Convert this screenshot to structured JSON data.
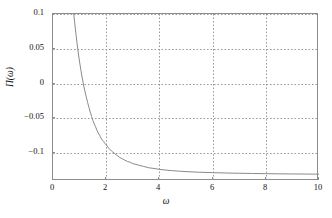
{
  "chart_data": {
    "type": "line",
    "title": "",
    "xlabel": "ω",
    "ylabel": "Π(ω)",
    "xlim": [
      0,
      10
    ],
    "ylim": [
      -0.14,
      0.1
    ],
    "grid": true,
    "grid_style": "dotted",
    "legend": null,
    "xticks": [
      0,
      2,
      4,
      6,
      8,
      10
    ],
    "xtick_labels": [
      "0",
      "2",
      "4",
      "6",
      "8",
      "10"
    ],
    "yticks": [
      -0.1,
      -0.05,
      0,
      0.05,
      0.1
    ],
    "ytick_labels": [
      "−0.1",
      "−0.05",
      "0",
      "0.05",
      "0.1"
    ],
    "series": [
      {
        "name": "Π(ω)",
        "color": "#8a8a8a",
        "linewidth": 1,
        "x": [
          0.78,
          0.82,
          0.86,
          0.9,
          0.95,
          1.0,
          1.05,
          1.1,
          1.15,
          1.2,
          1.25,
          1.3,
          1.35,
          1.4,
          1.45,
          1.5,
          1.55,
          1.6,
          1.65,
          1.7,
          1.75,
          1.8,
          1.85,
          1.9,
          1.95,
          2.0,
          2.1,
          2.2,
          2.3,
          2.4,
          2.5,
          2.6,
          2.7,
          2.8,
          2.9,
          3.0,
          3.2,
          3.4,
          3.6,
          3.8,
          4.0,
          4.25,
          4.5,
          4.75,
          5.0,
          5.5,
          6.0,
          6.5,
          7.0,
          7.5,
          8.0,
          8.5,
          9.0,
          9.5,
          10.0
        ],
        "y": [
          0.1,
          0.086,
          0.072,
          0.059,
          0.044,
          0.031,
          0.019,
          0.008,
          -0.002,
          -0.011,
          -0.019,
          -0.027,
          -0.034,
          -0.041,
          -0.047,
          -0.053,
          -0.058,
          -0.062,
          -0.067,
          -0.071,
          -0.074,
          -0.078,
          -0.081,
          -0.083,
          -0.086,
          -0.088,
          -0.093,
          -0.097,
          -0.1,
          -0.103,
          -0.106,
          -0.108,
          -0.11,
          -0.112,
          -0.113,
          -0.115,
          -0.117,
          -0.119,
          -0.121,
          -0.122,
          -0.1233,
          -0.1243,
          -0.1252,
          -0.1259,
          -0.1265,
          -0.1274,
          -0.128,
          -0.1285,
          -0.1289,
          -0.1292,
          -0.1295,
          -0.1297,
          -0.1299,
          -0.13,
          -0.1302
        ]
      }
    ]
  },
  "axes": {
    "frame_color": "#8c8c8c",
    "grid_color": "#9a9a9a",
    "background": "#ffffff"
  }
}
